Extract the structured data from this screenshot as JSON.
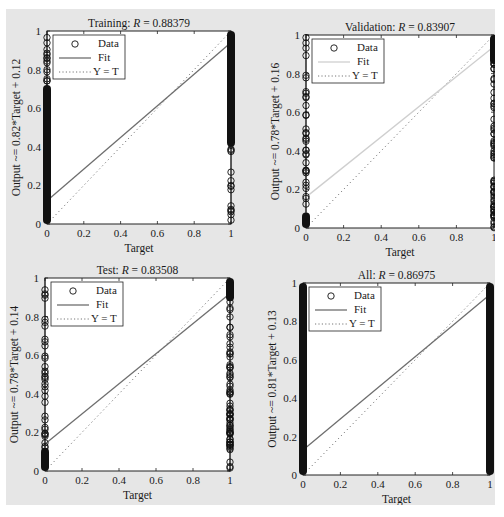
{
  "figure": {
    "background": "#e6e6e6",
    "axes_background": "#ffffff",
    "data_color": "#111111",
    "fit_color": "#6e6e6e",
    "fit_color_validation": "#cfcfcf",
    "ident_color": "#777777"
  },
  "chart_data": [
    {
      "id": "training",
      "type": "scatter",
      "title_prefix": "Training: ",
      "title_var": "R",
      "title_value": " = 0.88379",
      "R": 0.88379,
      "xlabel": "Target",
      "ylabel": "Output ~= 0.82*Target + 0.12",
      "xlim": [
        0,
        1
      ],
      "ylim": [
        0,
        1
      ],
      "xticks": [
        "0",
        "0.2",
        "0.4",
        "0.6",
        "0.8",
        "1"
      ],
      "yticks": [
        "0",
        "0.2",
        "0.4",
        "0.6",
        "0.8",
        "1"
      ],
      "fit": {
        "slope": 0.82,
        "intercept": 0.12
      },
      "legend": [
        "Data",
        "Fit",
        "Y = T"
      ],
      "legend_position": "upper left",
      "data_summary": {
        "target_0_outputs": "dense from 0 to ~0.72, sparse markers up to 1.0",
        "target_1_outputs": "dense from ~0.4 to 1.0, sparse markers down to 0"
      },
      "box": {
        "x": 41,
        "y": 22,
        "w": 184,
        "h": 193
      }
    },
    {
      "id": "validation",
      "type": "scatter",
      "title_prefix": "Validation: ",
      "title_var": "R",
      "title_value": " = 0.83907",
      "R": 0.83907,
      "xlabel": "Target",
      "ylabel": "Output ~= 0.78*Target + 0.16",
      "xlim": [
        0,
        1
      ],
      "ylim": [
        0,
        1
      ],
      "xticks": [
        "0",
        "0.2",
        "0.4",
        "0.6",
        "0.8",
        "1"
      ],
      "yticks": [
        "0",
        "0.2",
        "0.4",
        "0.6",
        "0.8",
        "1"
      ],
      "fit": {
        "slope": 0.78,
        "intercept": 0.16
      },
      "legend": [
        "Data",
        "Fit",
        "Y = T"
      ],
      "legend_position": "upper left",
      "data_summary": {
        "target_0_outputs": "dense 0 to ~0.1, scattered circles up to 1.0",
        "target_1_outputs": "dense ~0.35 to 1.0, scattered circles down to 0"
      },
      "box": {
        "x": 300,
        "y": 26,
        "w": 188,
        "h": 193
      }
    },
    {
      "id": "test",
      "type": "scatter",
      "title_prefix": "Test: ",
      "title_var": "R",
      "title_value": " = 0.83508",
      "R": 0.83508,
      "xlabel": "Target",
      "ylabel": "Output ~= 0.78*Target + 0.14",
      "xlim": [
        0,
        1
      ],
      "ylim": [
        0,
        1
      ],
      "xticks": [
        "0",
        "0.2",
        "0.4",
        "0.6",
        "0.8",
        "1"
      ],
      "yticks": [
        "0",
        "0.2",
        "0.4",
        "0.6",
        "0.8",
        "1"
      ],
      "fit": {
        "slope": 0.78,
        "intercept": 0.14
      },
      "legend": [
        "Data",
        "Fit",
        "Y = T"
      ],
      "legend_position": "upper left",
      "data_summary": {
        "target_0_outputs": "dense 0 to ~0.15, scattered circles up to 1.0",
        "target_1_outputs": "dense ~0.3 to 1.0, scattered circles down to 0"
      },
      "box": {
        "x": 39,
        "y": 269,
        "w": 185,
        "h": 193
      }
    },
    {
      "id": "all",
      "type": "scatter",
      "title_prefix": "All: ",
      "title_var": "R",
      "title_value": " = 0.86975",
      "R": 0.86975,
      "xlabel": "Target",
      "ylabel": "Output ~= 0.81*Target + 0.13",
      "xlim": [
        0,
        1
      ],
      "ylim": [
        0,
        1
      ],
      "xticks": [
        "0",
        "0.2",
        "0.4",
        "0.6",
        "0.8",
        "1"
      ],
      "yticks": [
        "0",
        "0.2",
        "0.4",
        "0.6",
        "0.8",
        "1"
      ],
      "fit": {
        "slope": 0.81,
        "intercept": 0.13
      },
      "legend": [
        "Data",
        "Fit",
        "Y = T"
      ],
      "legend_position": "upper left",
      "data_summary": {
        "target_0_outputs": "dense 0 to 1.0 (solid column)",
        "target_1_outputs": "dense 0 to 1.0 (solid column)"
      },
      "box": {
        "x": 297,
        "y": 274,
        "w": 187,
        "h": 192
      }
    }
  ]
}
